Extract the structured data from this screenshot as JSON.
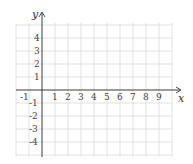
{
  "diagram": {
    "type": "coordinate-grid",
    "x_axis": {
      "label": "x",
      "min": -1,
      "max": 9,
      "ticks": [
        "-1",
        "1",
        "2",
        "3",
        "4",
        "5",
        "6",
        "7",
        "8",
        "9"
      ]
    },
    "y_axis": {
      "label": "y",
      "min": -4,
      "max": 4,
      "ticks": [
        "4",
        "3",
        "2",
        "1",
        "-1",
        "-2",
        "-3",
        "-4"
      ]
    },
    "grid_color": "#d9d9d9",
    "axis_color": "#3a3a3a"
  }
}
